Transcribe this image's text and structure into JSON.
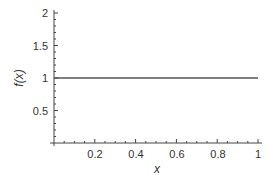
{
  "chart_data": {
    "type": "line",
    "title": "",
    "xlabel": "x",
    "ylabel": "f(x)",
    "xlim": [
      0,
      1
    ],
    "ylim": [
      0,
      2
    ],
    "x_ticks": [
      0.2,
      0.4,
      0.6,
      0.8,
      1
    ],
    "x_tick_labels": [
      "0.2",
      "0.4",
      "0.6",
      "0.8",
      "1"
    ],
    "y_ticks": [
      0.5,
      1,
      1.5,
      2
    ],
    "y_tick_labels": [
      "0.5",
      "1",
      "1.5",
      "2"
    ],
    "grid": false,
    "legend": null,
    "series": [
      {
        "name": "f(x)",
        "x": [
          0,
          1
        ],
        "y": [
          1,
          1
        ],
        "color": "#555555"
      }
    ]
  }
}
